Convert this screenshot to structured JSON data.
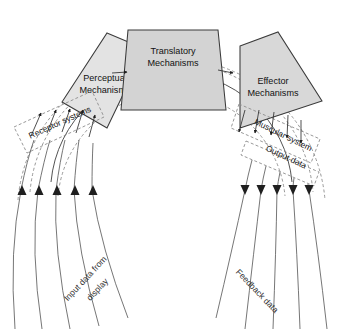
{
  "diagram": {
    "title_label": "Body boundary",
    "central_label": "Central",
    "blocks": [
      {
        "id": "perceptual",
        "line1": "Perceptual",
        "line2": "Mechanisms",
        "fill": "#e3e3e3"
      },
      {
        "id": "translatory",
        "line1": "Translatory",
        "line2": "Mechanisms",
        "fill": "#d3d3d3"
      },
      {
        "id": "effector",
        "line1": "Effector",
        "line2": "Mechanisms",
        "fill": "#d8d8d8"
      }
    ],
    "bands": [
      {
        "id": "receptor",
        "label": "Receptor systems"
      },
      {
        "id": "muscular",
        "label": "Muscular system"
      }
    ],
    "flow_labels": [
      {
        "id": "input",
        "line1": "Input data from",
        "line2": "display"
      },
      {
        "id": "output",
        "line1": "Output data"
      },
      {
        "id": "feedback",
        "line1": "Feedback data"
      }
    ],
    "colors": {
      "stroke": "#3a3a3a",
      "dashed": "#8d8d8d",
      "flow": "#5d5d5d",
      "text": "#111111",
      "background": "#ffffff"
    },
    "counts": {
      "input_streams": 5,
      "output_streams": 5,
      "receptor_arrows": 5,
      "muscular_arrows": 5
    }
  }
}
